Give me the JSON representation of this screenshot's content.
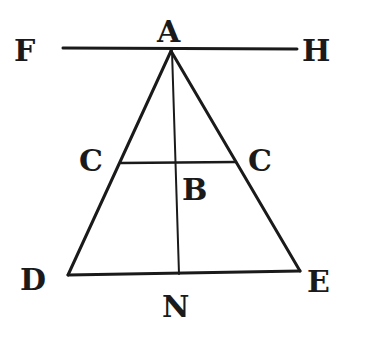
{
  "diagram": {
    "type": "geometric-figure",
    "colors": {
      "ink": "#1a1a1a",
      "background": "#ffffff"
    },
    "labels": {
      "F": "F",
      "A": "A",
      "H": "H",
      "C_left": "C",
      "C_right": "C",
      "B": "B",
      "D": "D",
      "E": "E",
      "N": "N"
    },
    "points": {
      "A": [
        171,
        51
      ],
      "C_left": [
        121,
        163
      ],
      "C_right": [
        236,
        162
      ],
      "B": [
        176,
        163
      ],
      "D": [
        68,
        275
      ],
      "E": [
        300,
        271
      ],
      "N": [
        179,
        274
      ],
      "F_end": [
        63,
        48
      ],
      "H_end": [
        297,
        48
      ]
    },
    "segments": [
      {
        "name": "FH",
        "from": "F_end",
        "to": "H_end"
      },
      {
        "name": "AD",
        "from": "A",
        "to": "D"
      },
      {
        "name": "AE",
        "from": "A",
        "to": "E"
      },
      {
        "name": "CC",
        "from": "C_left",
        "to": "C_right"
      },
      {
        "name": "DE",
        "from": "D",
        "to": "E"
      },
      {
        "name": "AN",
        "from": "A",
        "to": "N"
      }
    ]
  }
}
